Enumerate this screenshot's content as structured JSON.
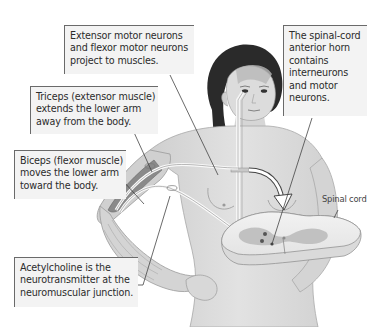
{
  "figure": {
    "colors": {
      "callout_bg": "#f3f3f3",
      "callout_border": "#6a6a6a",
      "text": "#2b2b2b",
      "skin": "#d9d9d9",
      "hair": "#2a2a2a",
      "muscle": "#8a8a8a",
      "spinal_cord": "#ececec",
      "gray_matter": "#bdbdbd"
    }
  },
  "callouts": [
    {
      "id": "motor-neurons",
      "lines": [
        "Extensor motor neurons",
        "and flexor motor neurons",
        "project to muscles."
      ]
    },
    {
      "id": "triceps",
      "lines": [
        "Triceps (extensor muscle)",
        "extends the lower arm",
        "away from the body."
      ]
    },
    {
      "id": "biceps",
      "lines": [
        "Biceps (flexor muscle)",
        "moves the lower arm",
        "toward the body."
      ]
    },
    {
      "id": "acetylcholine",
      "lines": [
        "Acetylcholine is the",
        "neurotransmitter at the",
        "neuromuscular junction."
      ]
    },
    {
      "id": "anterior-horn",
      "lines": [
        "The spinal-cord",
        "anterior horn",
        "contains",
        "interneurons",
        "and motor",
        "neurons."
      ]
    }
  ],
  "labels": {
    "spinal_cord": "Spinal cord"
  }
}
